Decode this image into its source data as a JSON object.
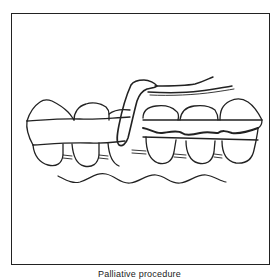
{
  "figure": {
    "caption": "Palliative procedure",
    "colors": {
      "line": "#222222",
      "background": "#ffffff"
    }
  }
}
